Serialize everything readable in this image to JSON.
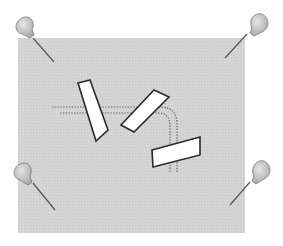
{
  "diagram": {
    "colors": {
      "background": "#ffffff",
      "board": "#d3d3d3",
      "strip_fill": "#ffffff",
      "strip_stroke": "#2a2a2a",
      "dotted_line": "#6e6e6e",
      "pin_head": "#bdbdbd",
      "pin_head_stroke": "#7a7a7a",
      "pin_needle": "#555555"
    },
    "board": {
      "x": 18,
      "y": 38,
      "width": 227,
      "height": 195
    },
    "pins": [
      {
        "name": "top-left",
        "head": [
          27,
          28
        ],
        "tip": [
          54,
          62
        ]
      },
      {
        "name": "top-right",
        "head": [
          257,
          22
        ],
        "tip": [
          225,
          58
        ]
      },
      {
        "name": "bottom-left",
        "head": [
          26,
          172
        ],
        "tip": [
          55,
          210
        ]
      },
      {
        "name": "bottom-right",
        "head": [
          260,
          170
        ],
        "tip": [
          230,
          205
        ]
      }
    ],
    "strips": [
      {
        "name": "strip-1",
        "points": "78,83 90,80 108,130 96,141"
      },
      {
        "name": "strip-2",
        "points": "121,125 154,90 169,97 134,132"
      },
      {
        "name": "strip-3",
        "points": "152,150 200,137 200,155 153,167"
      }
    ],
    "dotted_paths": [
      {
        "name": "path-outer",
        "d": "M52,107 L160,107 Q177,107 177,124 L177,172"
      },
      {
        "name": "path-inner",
        "d": "M60,113 L158,113 Q170,113 170,126 L170,172"
      }
    ]
  }
}
